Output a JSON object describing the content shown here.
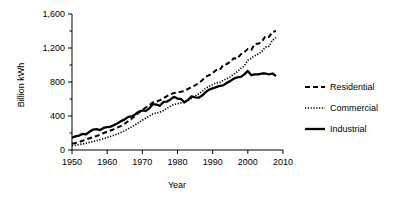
{
  "chart_data": {
    "type": "line",
    "title": "",
    "xlabel": "Year",
    "ylabel": "Billion kWh",
    "xlim": [
      1950,
      2010
    ],
    "ylim": [
      0,
      1600
    ],
    "xticks": [
      1950,
      1960,
      1970,
      1980,
      1990,
      2000,
      2010
    ],
    "xticklabels": [
      "1950",
      "1960",
      "1970",
      "1980",
      "1990",
      "2000",
      "2010"
    ],
    "yticks": [
      0,
      400,
      800,
      1200,
      1600
    ],
    "yticklabels": [
      "0",
      "400",
      "800",
      "1,200",
      "1,600"
    ],
    "yminorticks": [
      200,
      600,
      1000,
      1400
    ],
    "grid": false,
    "legend_position": "right",
    "x": [
      1950,
      1951,
      1952,
      1953,
      1954,
      1955,
      1956,
      1957,
      1958,
      1959,
      1960,
      1961,
      1962,
      1963,
      1964,
      1965,
      1966,
      1967,
      1968,
      1969,
      1970,
      1971,
      1972,
      1973,
      1974,
      1975,
      1976,
      1977,
      1978,
      1979,
      1980,
      1981,
      1982,
      1983,
      1984,
      1985,
      1986,
      1987,
      1988,
      1989,
      1990,
      1991,
      1992,
      1993,
      1994,
      1995,
      1996,
      1997,
      1998,
      1999,
      2000,
      2001,
      2002,
      2003,
      2004,
      2005,
      2006,
      2007,
      2008
    ],
    "series": [
      {
        "name": "Residential",
        "style": "dashed",
        "color": "#000000",
        "values": [
          73,
          83,
          95,
          108,
          122,
          138,
          152,
          165,
          180,
          200,
          215,
          230,
          245,
          265,
          285,
          310,
          340,
          370,
          405,
          440,
          470,
          500,
          530,
          560,
          570,
          585,
          610,
          635,
          655,
          670,
          680,
          685,
          695,
          720,
          740,
          760,
          785,
          820,
          860,
          880,
          905,
          940,
          940,
          1000,
          1010,
          1040,
          1080,
          1075,
          1125,
          1150,
          1190,
          1180,
          1250,
          1250,
          1275,
          1340,
          1330,
          1390,
          1400
        ]
      },
      {
        "name": "Commercial",
        "style": "dotted",
        "color": "#000000",
        "values": [
          50,
          56,
          63,
          71,
          80,
          90,
          100,
          110,
          122,
          135,
          148,
          160,
          175,
          190,
          208,
          228,
          250,
          272,
          298,
          325,
          350,
          375,
          400,
          425,
          435,
          445,
          465,
          490,
          515,
          535,
          545,
          555,
          565,
          585,
          610,
          635,
          660,
          690,
          725,
          750,
          770,
          790,
          795,
          820,
          840,
          860,
          890,
          920,
          960,
          990,
          1055,
          1080,
          1110,
          1130,
          1160,
          1210,
          1220,
          1290,
          1320
        ]
      },
      {
        "name": "Industrial",
        "style": "solid",
        "color": "#000000",
        "values": [
          145,
          160,
          170,
          190,
          185,
          215,
          240,
          245,
          235,
          260,
          270,
          275,
          295,
          315,
          340,
          360,
          390,
          395,
          420,
          450,
          465,
          460,
          490,
          540,
          535,
          520,
          565,
          570,
          595,
          625,
          605,
          600,
          560,
          590,
          630,
          620,
          615,
          640,
          680,
          710,
          725,
          740,
          755,
          760,
          790,
          810,
          840,
          855,
          860,
          890,
          930,
          880,
          890,
          890,
          900,
          900,
          890,
          900,
          870
        ]
      }
    ],
    "annotations": []
  },
  "legend": {
    "items": [
      {
        "label": "Residential",
        "style": "dashed"
      },
      {
        "label": "Commercial",
        "style": "dotted"
      },
      {
        "label": "Industrial",
        "style": "solid"
      }
    ]
  }
}
